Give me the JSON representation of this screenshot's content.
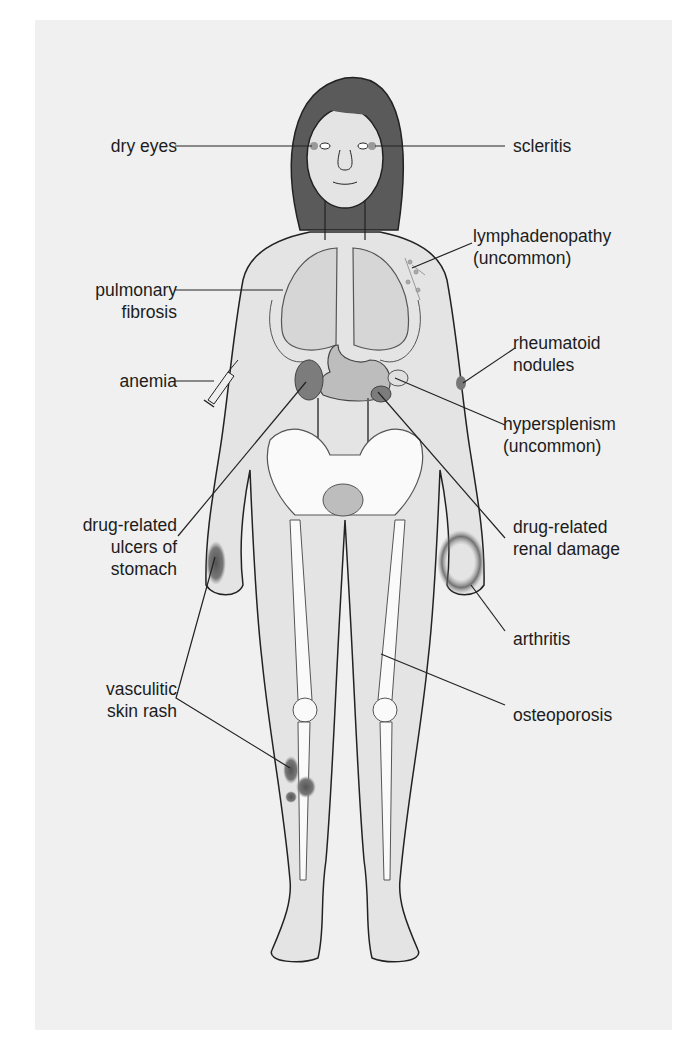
{
  "figure": {
    "colors": {
      "panel_background": "#f0f0f0",
      "skin_fill": "#e4e4e4",
      "hair_fill": "#5a5a5a",
      "bone_fill": "#fafafa",
      "organ_fill": "#bdbdbd",
      "kidney_fill": "#7c7c7c",
      "lesion_fill": "#6e6e6e",
      "line_color": "#222222",
      "text_color": "#1c1c1c"
    }
  },
  "labels": {
    "left": [
      {
        "id": "dry-eyes",
        "text": "dry eyes"
      },
      {
        "id": "pulmonary-fibrosis",
        "text": "pulmonary\nfibrosis"
      },
      {
        "id": "anemia",
        "text": "anemia"
      },
      {
        "id": "drug-related-ulcers",
        "text": "drug-related\nulcers of\nstomach"
      },
      {
        "id": "vasculitic-skin-rash",
        "text": "vasculitic\nskin rash"
      }
    ],
    "right": [
      {
        "id": "scleritis",
        "text": "scleritis"
      },
      {
        "id": "lymphadenopathy",
        "text": "lymphadenopathy\n(uncommon)"
      },
      {
        "id": "rheumatoid-nodules",
        "text": "rheumatoid\nnodules"
      },
      {
        "id": "hypersplenism",
        "text": "hypersplenism\n(uncommon)"
      },
      {
        "id": "drug-related-renal-damage",
        "text": "drug-related\nrenal damage"
      },
      {
        "id": "arthritis",
        "text": "arthritis"
      },
      {
        "id": "osteoporosis",
        "text": "osteoporosis"
      }
    ]
  }
}
